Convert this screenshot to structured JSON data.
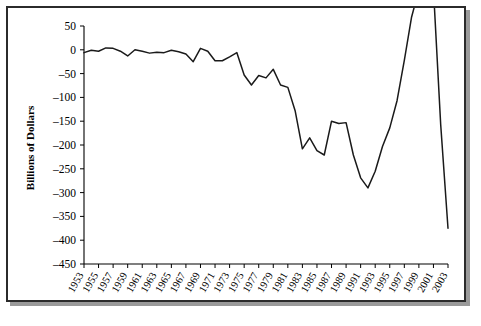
{
  "chart_data": {
    "type": "line",
    "title": "",
    "xlabel": "",
    "ylabel": "Billions of Dollars",
    "ylim": [
      -450,
      50
    ],
    "xlim": [
      1953,
      2003
    ],
    "grid": false,
    "legend": "none",
    "ytick_labels": [
      "50",
      "0",
      "–50",
      "–100",
      "–150",
      "–200",
      "–250",
      "–300",
      "–350",
      "–400",
      "–450"
    ],
    "ytick_values": [
      50,
      0,
      -50,
      -100,
      -150,
      -200,
      -250,
      -300,
      -350,
      -400,
      -450
    ],
    "xtick_labels": [
      "1953",
      "1955",
      "1957",
      "1959",
      "1961",
      "1963",
      "1965",
      "1967",
      "1969",
      "1971",
      "1973",
      "1975",
      "1977",
      "1979",
      "1981",
      "1983",
      "1985",
      "1987",
      "1989",
      "1991",
      "1993",
      "1995",
      "1997",
      "1999",
      "2001",
      "2003"
    ],
    "xtick_values": [
      1953,
      1955,
      1957,
      1959,
      1961,
      1963,
      1965,
      1967,
      1969,
      1971,
      1973,
      1975,
      1977,
      1979,
      1981,
      1983,
      1985,
      1987,
      1989,
      1991,
      1993,
      1995,
      1997,
      1999,
      2001,
      2003
    ],
    "x": [
      1953,
      1954,
      1955,
      1956,
      1957,
      1958,
      1959,
      1960,
      1961,
      1962,
      1963,
      1964,
      1965,
      1966,
      1967,
      1968,
      1969,
      1970,
      1971,
      1972,
      1973,
      1974,
      1975,
      1976,
      1977,
      1978,
      1979,
      1980,
      1981,
      1982,
      1983,
      1984,
      1985,
      1986,
      1987,
      1988,
      1989,
      1990,
      1991,
      1992,
      1993,
      1994,
      1995,
      1996,
      1997,
      1998,
      1999,
      2000,
      2001,
      2002,
      2003
    ],
    "values": [
      -6,
      -1,
      -3,
      4,
      3,
      -3,
      -13,
      0,
      -3,
      -7,
      -5,
      -6,
      -1,
      -4,
      -9,
      -25,
      3,
      -3,
      -23,
      -23,
      -15,
      -6,
      -53,
      -74,
      -54,
      -59,
      -41,
      -74,
      -79,
      -128,
      -208,
      -185,
      -212,
      -221,
      -150,
      -155,
      -153,
      -221,
      -269,
      -290,
      -255,
      -203,
      -164,
      -107,
      -22,
      69,
      126,
      236,
      128,
      -158,
      -375
    ],
    "series_name": "Federal budget surplus/deficit"
  }
}
